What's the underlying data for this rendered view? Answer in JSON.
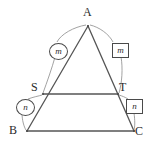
{
  "figure": {
    "type": "geometry-diagram",
    "stroke_color": "#555555",
    "label_color": "#2b2b2b",
    "background_color": "#ffffff",
    "vertices": [
      {
        "id": "A",
        "label": "A",
        "x": 88,
        "y": 26,
        "label_x": 83,
        "label_y": 6
      },
      {
        "id": "B",
        "label": "B",
        "x": 27,
        "y": 131,
        "label_x": 9,
        "label_y": 124
      },
      {
        "id": "C",
        "label": "C",
        "x": 134,
        "y": 131,
        "label_x": 135,
        "label_y": 125
      },
      {
        "id": "S",
        "label": "S",
        "x": 43,
        "y": 94,
        "label_x": 31,
        "label_y": 81
      },
      {
        "id": "T",
        "label": "T",
        "x": 118,
        "y": 94,
        "label_x": 119,
        "label_y": 81
      }
    ],
    "segments": [
      {
        "name": "side-AB",
        "from": "A",
        "to": "B"
      },
      {
        "name": "side-AC",
        "from": "A",
        "to": "C"
      },
      {
        "name": "base-BC",
        "from": "B",
        "to": "C"
      },
      {
        "name": "midsegment-ST",
        "from": "S",
        "to": "T"
      }
    ],
    "tags": [
      {
        "id": "m-left",
        "text": "m",
        "shape": "circle",
        "x": 49,
        "y": 43,
        "marks_segment": "AS"
      },
      {
        "id": "m-right",
        "text": "m",
        "shape": "box",
        "x": 112,
        "y": 43,
        "marks_segment": "AT"
      },
      {
        "id": "n-left",
        "text": "n",
        "shape": "circle",
        "x": 16,
        "y": 99,
        "marks_segment": "SB"
      },
      {
        "id": "n-right",
        "text": "n",
        "shape": "box",
        "x": 126,
        "y": 99,
        "marks_segment": "TC"
      }
    ]
  }
}
